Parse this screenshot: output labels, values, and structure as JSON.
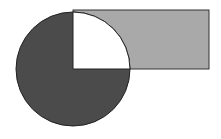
{
  "diagram": {
    "type": "geometric-figure",
    "canvas": {
      "width": 221,
      "height": 139,
      "background": "#ffffff"
    },
    "shapes": {
      "rectangle": {
        "x": 73,
        "y": 10,
        "width": 136,
        "height": 59,
        "fill": "#a9a9a9",
        "stroke": "#333333"
      },
      "circle": {
        "cx": 73,
        "cy": 69,
        "r": 57,
        "fill": "#4b4b4b",
        "stroke": "#222222"
      },
      "quarter_cutout": {
        "quadrant": "top-right",
        "fill": "#ffffff",
        "stroke": "#222222"
      }
    }
  }
}
